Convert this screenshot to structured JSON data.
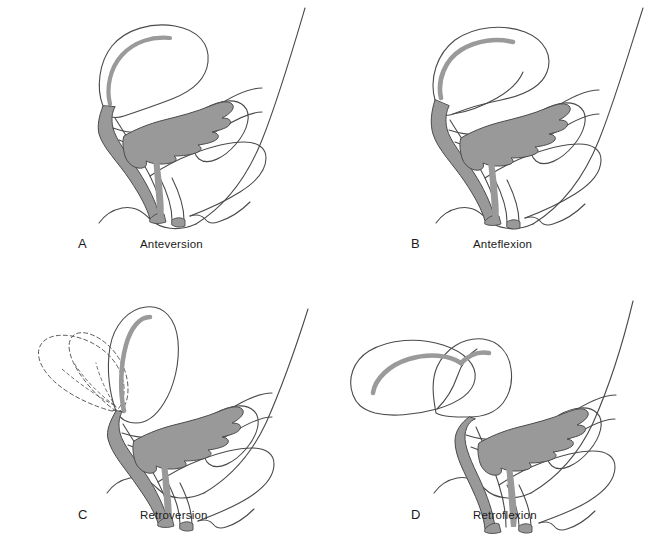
{
  "figure": {
    "background_color": "#ffffff",
    "line_color": "#4a4a4a",
    "fill_color": "#999999",
    "text_color": "#1a1a1a"
  },
  "panels": [
    {
      "id": "A",
      "letter": "A",
      "caption": "Anteversion",
      "description": "Uterus tilted forward over the bladder; body and cervix form a straight axis",
      "has_dashed_overlay": false
    },
    {
      "id": "B",
      "letter": "B",
      "caption": "Anteflexion",
      "description": "Uterine body bent sharply forward on the cervix",
      "has_dashed_overlay": false
    },
    {
      "id": "C",
      "letter": "C",
      "caption": "Retroversion",
      "description": "Whole uterus tilted backward; dashed outlines show intermediate positions",
      "has_dashed_overlay": true
    },
    {
      "id": "D",
      "letter": "D",
      "caption": "Retroflexion",
      "description": "Uterine body bent backward on the cervix",
      "has_dashed_overlay": false
    }
  ]
}
